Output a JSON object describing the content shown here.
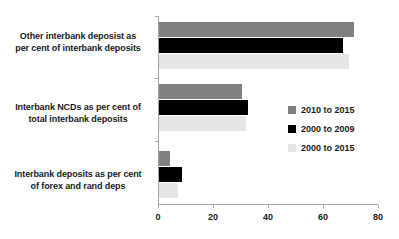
{
  "chart_data": {
    "type": "bar",
    "orientation": "horizontal",
    "title": "",
    "subtitle": "",
    "xlabel": "",
    "ylabel": "",
    "xlim": [
      0,
      80
    ],
    "xticks": [
      "0",
      "20",
      "40",
      "60",
      "80"
    ],
    "grid": false,
    "legend_position": "center-right",
    "categories": [
      "Other interbank deposist as per cent of interbank deposits",
      "Interbank NCDs as per cent of total interbank deposits",
      "Interbank deposits as per cent of forex and rand deps"
    ],
    "category_lines": [
      [
        "Other interbank deposist as",
        "per cent of interbank deposits"
      ],
      [
        "Interbank NCDs as per cent of",
        "total interbank deposits"
      ],
      [
        "Interbank deposits as per cent",
        "of forex and rand deps"
      ]
    ],
    "series": [
      {
        "name": "2010 to 2015",
        "color": "#808080",
        "values": [
          71,
          30,
          4
        ]
      },
      {
        "name": "2000 to 2009",
        "color": "#000000",
        "values": [
          67,
          32.5,
          8.5
        ]
      },
      {
        "name": "2000 to 2015",
        "color": "#e6e6e6",
        "values": [
          69,
          31.5,
          7
        ]
      }
    ]
  },
  "colors": {
    "axis": "#a6a6a6",
    "text": "#1a1a1a",
    "background": "#ffffff"
  }
}
